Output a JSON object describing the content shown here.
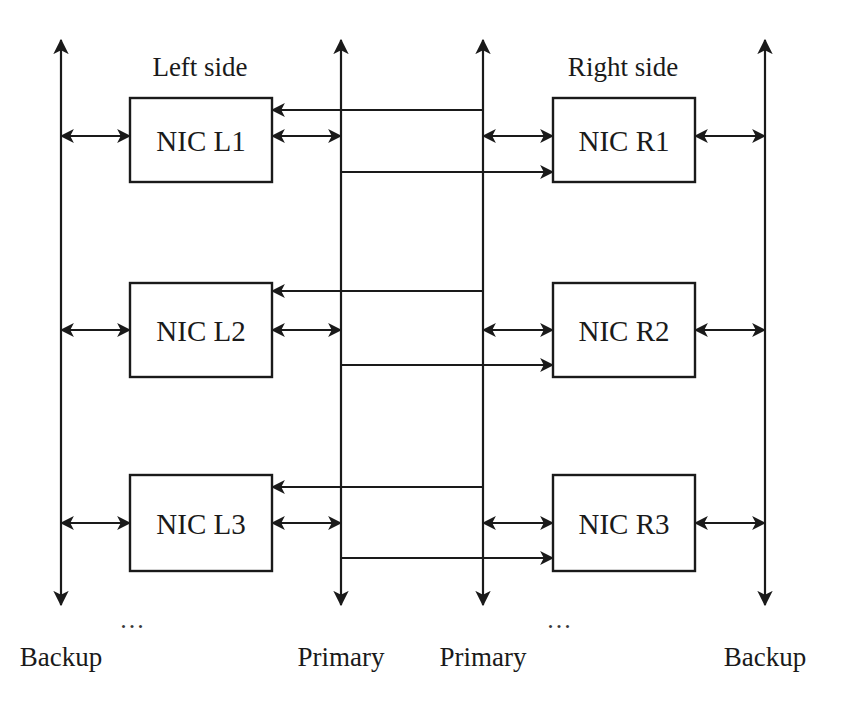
{
  "diagram": {
    "stroke_color": "#1a1a1a",
    "background_color": "#ffffff",
    "headers": [
      {
        "id": "left-side",
        "text": "Left side",
        "x": 200,
        "y": 67
      },
      {
        "id": "right-side",
        "text": "Right side",
        "x": 623,
        "y": 67
      }
    ],
    "nodes": [
      {
        "id": "nic-l1",
        "label": "NIC L1",
        "x": 130,
        "y": 98,
        "w": 142,
        "h": 84
      },
      {
        "id": "nic-l2",
        "label": "NIC L2",
        "x": 130,
        "y": 283,
        "w": 142,
        "h": 94
      },
      {
        "id": "nic-l3",
        "label": "NIC L3",
        "x": 130,
        "y": 475,
        "w": 142,
        "h": 96
      },
      {
        "id": "nic-r1",
        "label": "NIC R1",
        "x": 553,
        "y": 98,
        "w": 142,
        "h": 84
      },
      {
        "id": "nic-r2",
        "label": "NIC R2",
        "x": 553,
        "y": 283,
        "w": 142,
        "h": 94
      },
      {
        "id": "nic-r3",
        "label": "NIC R3",
        "x": 553,
        "y": 475,
        "w": 142,
        "h": 96
      }
    ],
    "buses": [
      {
        "id": "backup-left",
        "label": "Backup",
        "x": 61,
        "top": 40,
        "bottom": 605,
        "label_y": 657
      },
      {
        "id": "primary-left",
        "label": "Primary",
        "x": 341,
        "top": 40,
        "bottom": 605,
        "label_y": 657
      },
      {
        "id": "primary-right",
        "label": "Primary",
        "x": 483,
        "top": 40,
        "bottom": 605,
        "label_y": 657
      },
      {
        "id": "backup-right",
        "label": "Backup",
        "x": 765,
        "top": 40,
        "bottom": 605,
        "label_y": 657
      }
    ],
    "ellipses": [
      {
        "id": "ellipsis-left",
        "text": "...",
        "x": 133,
        "y": 620
      },
      {
        "id": "ellipsis-right",
        "text": "...",
        "x": 560,
        "y": 620
      }
    ],
    "links": {
      "backup_left": [
        {
          "id": "backup-l1",
          "y": 136,
          "from_x": 61,
          "to_x": 130
        },
        {
          "id": "backup-l2",
          "y": 330,
          "from_x": 61,
          "to_x": 130
        },
        {
          "id": "backup-l3",
          "y": 523,
          "from_x": 61,
          "to_x": 130
        }
      ],
      "backup_right": [
        {
          "id": "backup-r1",
          "y": 136,
          "from_x": 695,
          "to_x": 765
        },
        {
          "id": "backup-r2",
          "y": 330,
          "from_x": 695,
          "to_x": 765
        },
        {
          "id": "backup-r3",
          "y": 523,
          "from_x": 695,
          "to_x": 765
        }
      ],
      "primary_left_local": [
        {
          "id": "primary-left-l1",
          "y": 136,
          "from_x": 272,
          "to_x": 341
        },
        {
          "id": "primary-left-l2",
          "y": 330,
          "from_x": 272,
          "to_x": 341
        },
        {
          "id": "primary-left-l3",
          "y": 523,
          "from_x": 272,
          "to_x": 341
        }
      ],
      "primary_right_local": [
        {
          "id": "primary-right-r1",
          "y": 136,
          "from_x": 483,
          "to_x": 553
        },
        {
          "id": "primary-right-r2",
          "y": 330,
          "from_x": 483,
          "to_x": 553
        },
        {
          "id": "primary-right-r3",
          "y": 523,
          "from_x": 483,
          "to_x": 553
        }
      ],
      "cross_right_to_left": [
        {
          "id": "cross-r1-l1",
          "y": 110,
          "from_x": 483,
          "to_x": 272
        },
        {
          "id": "cross-r2-l2",
          "y": 291,
          "from_x": 483,
          "to_x": 272
        },
        {
          "id": "cross-r3-l3",
          "y": 487,
          "from_x": 483,
          "to_x": 272
        }
      ],
      "cross_left_to_right": [
        {
          "id": "cross-l1-r1",
          "y": 172,
          "from_x": 341,
          "to_x": 553
        },
        {
          "id": "cross-l2-r2",
          "y": 365,
          "from_x": 341,
          "to_x": 553
        },
        {
          "id": "cross-l3-r3",
          "y": 558,
          "from_x": 341,
          "to_x": 553
        }
      ]
    }
  }
}
